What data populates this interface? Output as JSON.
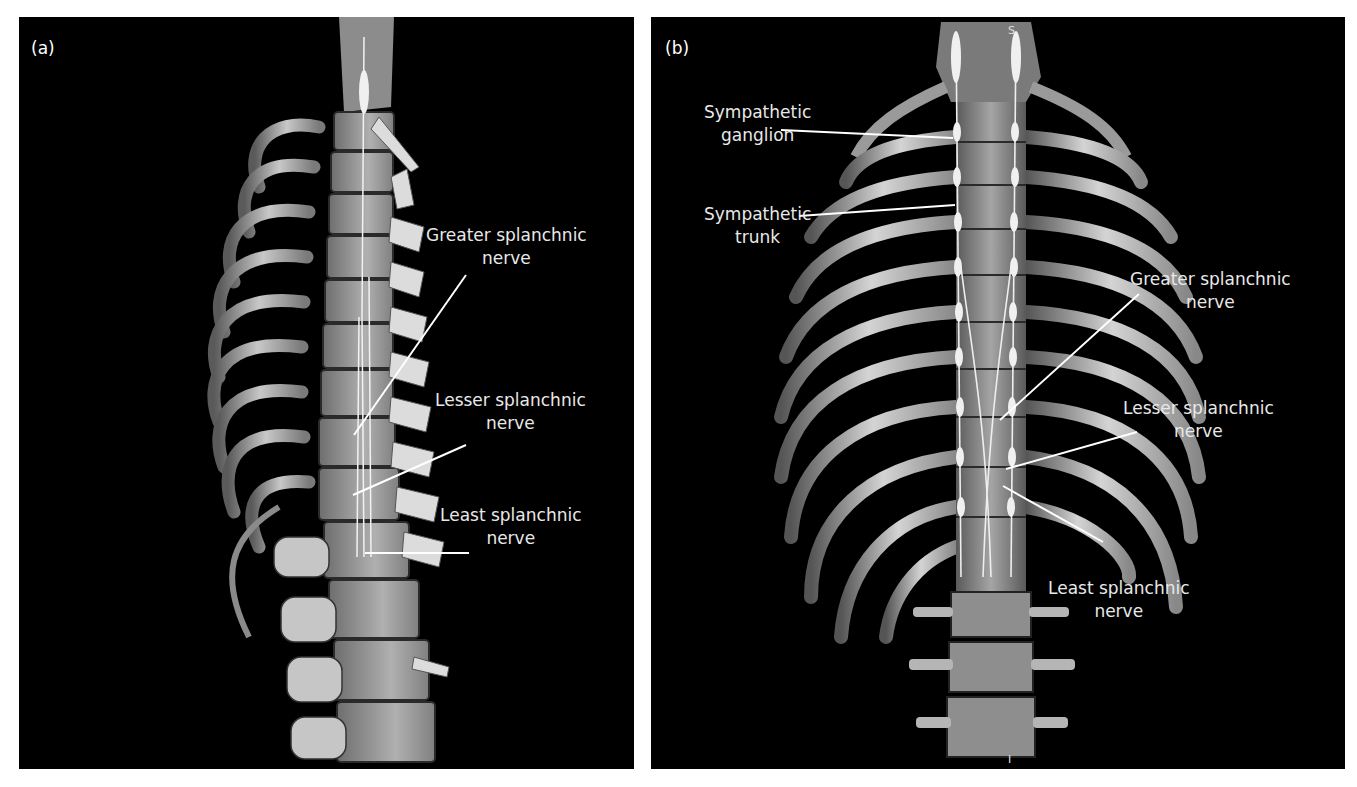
{
  "figure": {
    "panels": [
      {
        "id": "a",
        "letter": "(a)",
        "view": "lateral-oblique 3D CT rendering of thoracic spine and ribs",
        "labels": [
          {
            "line1": "Greater splanchnic",
            "line2": "nerve"
          },
          {
            "line1": "Lesser splanchnic",
            "line2": "nerve"
          },
          {
            "line1": "Least splanchnic",
            "line2": "nerve"
          }
        ]
      },
      {
        "id": "b",
        "letter": "(b)",
        "view": "anterior 3D CT rendering of thoracic spine and rib cage",
        "labels": [
          {
            "line1": "Sympathetic",
            "line2": "ganglion"
          },
          {
            "line1": "Sympathetic",
            "line2": "trunk"
          },
          {
            "line1": "Greater splanchnic",
            "line2": "nerve"
          },
          {
            "line1": "Lesser splanchnic",
            "line2": "nerve"
          },
          {
            "line1": "Least splanchnic",
            "line2": "nerve"
          }
        ],
        "orientation": {
          "top": "S",
          "bottom": "I"
        }
      }
    ],
    "colors": {
      "background": "#000000",
      "page": "#ffffff",
      "label_text": "#e8e8e8",
      "leader_line": "#ffffff",
      "bone": "#a8a8a8"
    }
  }
}
